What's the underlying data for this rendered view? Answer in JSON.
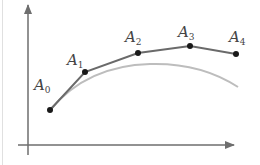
{
  "diagram": {
    "colors": {
      "axes": "#6e6e6e",
      "polyline": "#6a6a6a",
      "curve": "#bdbdbd",
      "points": "#1a1a1a",
      "labels": "#444444",
      "frame": "#e0e0e0"
    },
    "axes": {
      "origin": [
        28,
        145
      ],
      "y_axis_top": [
        28,
        5
      ],
      "x_axis_right": [
        234,
        145
      ]
    },
    "points": [
      {
        "name": "A",
        "sub": "0",
        "x": 50,
        "y": 110,
        "label_x": 34,
        "label_y": 78
      },
      {
        "name": "A",
        "sub": "1",
        "x": 85,
        "y": 72,
        "label_x": 67,
        "label_y": 53
      },
      {
        "name": "A",
        "sub": "2",
        "x": 138,
        "y": 53,
        "label_x": 125,
        "label_y": 30
      },
      {
        "name": "A",
        "sub": "3",
        "x": 190,
        "y": 46,
        "label_x": 178,
        "label_y": 25
      },
      {
        "name": "A",
        "sub": "4",
        "x": 236,
        "y": 54,
        "label_x": 229,
        "label_y": 30
      }
    ],
    "curve_path": "M50,110 C75,80 110,65 150,64 C185,63 215,72 238,87"
  }
}
